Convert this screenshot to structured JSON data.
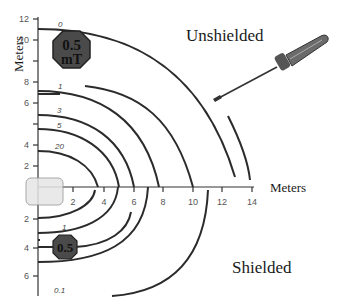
{
  "diagram": {
    "regions": {
      "unshielded": "Unshielded",
      "shielded": "Shielded"
    },
    "axes": {
      "x_title": "Meters",
      "y_title": "Meters",
      "x_ticks": [
        "2",
        "4",
        "6",
        "8",
        "10",
        "12",
        "14"
      ],
      "y_ticks_up": [
        "2",
        "4",
        "6",
        "8",
        "10",
        "12"
      ],
      "y_ticks_down": [
        "2",
        "4",
        "6"
      ]
    },
    "unshielded_contours": [
      {
        "label": "0",
        "radius_m": 11.5
      },
      {
        "label": "0.5",
        "radius_m": 9.3
      },
      {
        "label": "1",
        "radius_m": 7.0
      },
      {
        "label": "3",
        "radius_m": 5.4
      },
      {
        "label": "5",
        "radius_m": 4.4
      },
      {
        "label": "20",
        "radius_m": 2.8
      }
    ],
    "shielded_contours": [
      {
        "label": "1",
        "depth_m": 3.0
      },
      {
        "label": "0.5",
        "depth_m": 4.0
      },
      {
        "label": "",
        "depth_m": 5.0
      },
      {
        "label": "0.1",
        "depth_m": 8.0
      }
    ],
    "badges": {
      "upper": {
        "line1": "0.5",
        "line2": "mT"
      },
      "lower": {
        "line1": "0.5"
      }
    },
    "icons": {
      "tool": "screwdriver-icon",
      "source": "magnet-source-box"
    },
    "colors": {
      "line": "#2b2b2b",
      "badge_fill": "#4a4a4a",
      "badge_border": "#222222",
      "source_fill": "#e6e6e6"
    }
  }
}
